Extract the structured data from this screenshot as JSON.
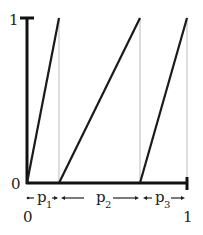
{
  "diagram": {
    "y_axis": {
      "top_label": "1",
      "bottom_label": "0"
    },
    "x_axis": {
      "left_label": "0",
      "right_label": "1"
    },
    "segments": [
      {
        "name": "p",
        "sub": "1"
      },
      {
        "name": "p",
        "sub": "2"
      },
      {
        "name": "p",
        "sub": "3"
      }
    ],
    "colors": {
      "line": "#1a1a1a",
      "guide": "#bbbbbb"
    }
  }
}
